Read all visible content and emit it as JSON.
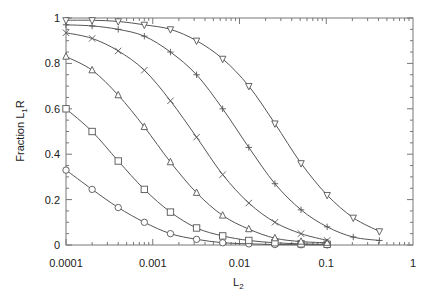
{
  "chart_data": {
    "type": "line",
    "title": "",
    "xlabel": "L2",
    "xlabel_main": "L",
    "xlabel_sub": "2",
    "ylabel": "Fraction L1R",
    "ylabel_main": "Fraction L",
    "ylabel_sub": "1",
    "ylabel_tail": "R",
    "xscale": "log",
    "xlim": [
      0.0001,
      1
    ],
    "ylim": [
      0,
      1
    ],
    "grid": false,
    "legend": null,
    "x_ticks": [
      0.0001,
      0.001,
      0.01,
      0.1,
      1
    ],
    "x_tick_labels": [
      "0.0001",
      "0.001",
      "0.01",
      "0.1",
      "1"
    ],
    "y_ticks": [
      0,
      0.2,
      0.4,
      0.6,
      0.8,
      1
    ],
    "y_tick_labels": [
      "0",
      "0.2",
      "0.4",
      "0.6",
      "0.8",
      "1"
    ],
    "series": [
      {
        "name": "circle",
        "marker": "circle",
        "x": [
          0.0001,
          0.0002,
          0.0004,
          0.0008,
          0.0016,
          0.0032,
          0.0064,
          0.0128,
          0.0256,
          0.0512,
          0.1024
        ],
        "values": [
          0.33,
          0.245,
          0.165,
          0.1,
          0.05,
          0.025,
          0.01,
          0.005,
          0.002,
          0.001,
          0.0005
        ]
      },
      {
        "name": "square",
        "marker": "square",
        "x": [
          0.0001,
          0.0002,
          0.0004,
          0.0008,
          0.0016,
          0.0032,
          0.0064,
          0.0128,
          0.0256,
          0.0512,
          0.1024
        ],
        "values": [
          0.6,
          0.5,
          0.37,
          0.245,
          0.145,
          0.075,
          0.04,
          0.02,
          0.01,
          0.005,
          0.003
        ]
      },
      {
        "name": "triangle-up",
        "marker": "triangle-up",
        "x": [
          0.0001,
          0.0002,
          0.0004,
          0.0008,
          0.0016,
          0.0032,
          0.0064,
          0.0128,
          0.0256,
          0.0512,
          0.1024
        ],
        "values": [
          0.83,
          0.77,
          0.66,
          0.52,
          0.365,
          0.23,
          0.13,
          0.07,
          0.03,
          0.015,
          0.01
        ]
      },
      {
        "name": "cross",
        "marker": "x",
        "x": [
          0.0001,
          0.0002,
          0.0004,
          0.0008,
          0.0016,
          0.0032,
          0.0064,
          0.0128,
          0.0256,
          0.0512,
          0.1024
        ],
        "values": [
          0.935,
          0.91,
          0.855,
          0.77,
          0.635,
          0.475,
          0.31,
          0.185,
          0.1,
          0.05,
          0.02
        ]
      },
      {
        "name": "plus",
        "marker": "plus",
        "x": [
          0.0001,
          0.0002,
          0.0004,
          0.0008,
          0.0016,
          0.0032,
          0.0064,
          0.0128,
          0.0256,
          0.0512,
          0.1024,
          0.2048,
          0.4096
        ],
        "values": [
          0.97,
          0.965,
          0.95,
          0.92,
          0.85,
          0.75,
          0.6,
          0.43,
          0.27,
          0.155,
          0.08,
          0.035,
          0.02
        ]
      },
      {
        "name": "triangle-down",
        "marker": "triangle-down",
        "x": [
          0.0001,
          0.0002,
          0.0004,
          0.0008,
          0.0016,
          0.0032,
          0.0064,
          0.0128,
          0.0256,
          0.0512,
          0.1024,
          0.2048,
          0.4096
        ],
        "values": [
          0.99,
          0.99,
          0.985,
          0.97,
          0.95,
          0.9,
          0.82,
          0.7,
          0.535,
          0.36,
          0.22,
          0.12,
          0.06
        ]
      }
    ]
  },
  "style": {
    "line_color": "#555555",
    "axis_color": "#777777",
    "text_color": "#1a1a1a"
  }
}
